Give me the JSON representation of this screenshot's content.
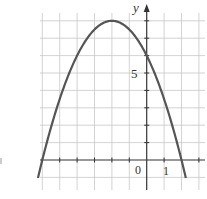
{
  "chart_data": {
    "type": "line",
    "title": "",
    "xlabel": "",
    "ylabel": "y",
    "function": "y = -0.5x^2 - 2x + 6",
    "vertex": [
      -2,
      8
    ],
    "y_intercept": 6,
    "x_intercepts": [
      -6,
      2
    ],
    "xlim": [
      -6,
      3
    ],
    "ylim": [
      -1.7,
      8.5
    ],
    "grid": true,
    "tick_labels": {
      "x": [
        "0",
        "1"
      ],
      "y": [
        "5"
      ]
    },
    "series": [
      {
        "name": "parabola",
        "x": [
          -6.2,
          -6,
          -5,
          -4,
          -3,
          -2,
          -1,
          0,
          1,
          2,
          2.2
        ],
        "y": [
          -0.82,
          0,
          3.5,
          6,
          7.5,
          8,
          7.5,
          6,
          3.5,
          0,
          -0.82
        ]
      }
    ]
  },
  "labels": {
    "y_axis": "y",
    "origin": "0",
    "x_one": "1",
    "y_five": "5"
  },
  "colors": {
    "grid": "#c8c8c8",
    "axis": "#333333",
    "curve": "#555555"
  }
}
